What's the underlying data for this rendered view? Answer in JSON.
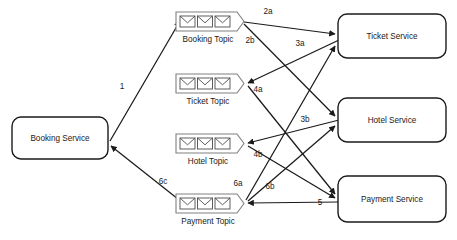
{
  "diagram": {
    "colors": {
      "stroke": "#1a1a1a",
      "topic_stroke": "#808080",
      "background": "#ffffff",
      "text": "#1a1a1a"
    },
    "services": [
      {
        "id": "booking",
        "label": "Booking Service",
        "x": 12,
        "y": 117,
        "w": 96,
        "h": 42
      },
      {
        "id": "ticket",
        "label": "Ticket Service",
        "x": 338,
        "y": 14,
        "w": 108,
        "h": 44
      },
      {
        "id": "hotel",
        "label": "Hotel Service",
        "x": 338,
        "y": 98,
        "w": 108,
        "h": 44
      },
      {
        "id": "payment",
        "label": "Payment Service",
        "x": 338,
        "y": 176,
        "w": 108,
        "h": 46
      }
    ],
    "topics": [
      {
        "id": "booking-topic",
        "label": "Booking Topic",
        "x": 176,
        "y": 12,
        "w": 68,
        "h": 19,
        "messages": 3
      },
      {
        "id": "ticket-topic",
        "label": "Ticket Topic",
        "x": 176,
        "y": 74,
        "w": 68,
        "h": 19,
        "messages": 3
      },
      {
        "id": "hotel-topic",
        "label": "Hotel Topic",
        "x": 176,
        "y": 134,
        "w": 68,
        "h": 19,
        "messages": 3
      },
      {
        "id": "payment-topic",
        "label": "Payment Topic",
        "x": 176,
        "y": 194,
        "w": 68,
        "h": 19,
        "messages": 3
      }
    ],
    "edges": [
      {
        "id": "e1",
        "label": "1",
        "from": "booking-service",
        "to": "booking-topic",
        "label_x": 122,
        "label_y": 89,
        "path": "M 110 141 L 180 21"
      },
      {
        "id": "e2a",
        "label": "2a",
        "from": "booking-topic",
        "to": "ticket-service",
        "label_x": 268,
        "label_y": 14,
        "path": "M 244 22 L 335 34"
      },
      {
        "id": "e2b",
        "label": "2b",
        "from": "booking-topic",
        "to": "hotel-service",
        "label_x": 250,
        "label_y": 43,
        "path": "M 244 24 L 335 116"
      },
      {
        "id": "e3a",
        "label": "3a",
        "from": "ticket-service",
        "to": "ticket-topic",
        "label_x": 300,
        "label_y": 46,
        "path": "M 339 40 L 248 83"
      },
      {
        "id": "e4a",
        "label": "4a",
        "from": "ticket-topic",
        "to": "payment-service",
        "label_x": 258,
        "label_y": 92,
        "path": "M 248 86 L 335 194"
      },
      {
        "id": "e3b",
        "label": "3b",
        "from": "hotel-service",
        "to": "hotel-topic",
        "label_x": 305,
        "label_y": 122,
        "path": "M 339 120 L 248 143"
      },
      {
        "id": "e4b",
        "label": "4b",
        "from": "hotel-topic",
        "to": "payment-service",
        "label_x": 258,
        "label_y": 157,
        "path": "M 248 146 L 335 198"
      },
      {
        "id": "e5",
        "label": "5",
        "from": "payment-service",
        "to": "payment-topic",
        "label_x": 320,
        "label_y": 205,
        "path": "M 339 202 L 248 203"
      },
      {
        "id": "e6a",
        "label": "6a",
        "from": "payment-topic",
        "to": "ticket-service",
        "label_x": 238,
        "label_y": 186,
        "path": "M 246 200 L 335 46"
      },
      {
        "id": "e6b",
        "label": "6b",
        "from": "payment-topic",
        "to": "hotel-service",
        "label_x": 270,
        "label_y": 189,
        "path": "M 248 201 L 335 126"
      },
      {
        "id": "6c",
        "label": "6c",
        "from": "payment-topic",
        "to": "booking-service",
        "label_x": 163,
        "label_y": 184,
        "path": "M 178 199 L 111 146"
      }
    ],
    "edge_labels": [
      "1",
      "2a",
      "2b",
      "3a",
      "3b",
      "4a",
      "4b",
      "5",
      "6a",
      "6b",
      "6c"
    ]
  }
}
